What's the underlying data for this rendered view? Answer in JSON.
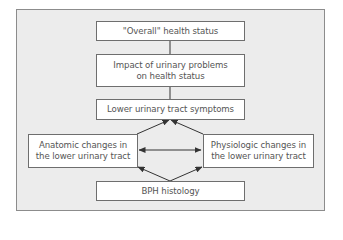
{
  "diagram": {
    "nodes": [
      {
        "id": "overall",
        "label": "\"Overall\" health status"
      },
      {
        "id": "impact",
        "label": "Impact of urinary problems\non health status"
      },
      {
        "id": "luts",
        "label": "Lower urinary tract symptoms"
      },
      {
        "id": "anatomic",
        "label": "Anatomic changes in\nthe lower urinary tract"
      },
      {
        "id": "physiologic",
        "label": "Physiologic changes in\nthe lower urinary tract"
      },
      {
        "id": "bph",
        "label": "BPH histology"
      }
    ],
    "edges": [
      {
        "from": "overall",
        "to": "impact",
        "type": "line"
      },
      {
        "from": "impact",
        "to": "luts",
        "type": "line"
      },
      {
        "from": "anatomic",
        "to": "luts",
        "type": "arrow"
      },
      {
        "from": "physiologic",
        "to": "luts",
        "type": "arrow"
      },
      {
        "from": "anatomic",
        "to": "physiologic",
        "type": "double-arrow"
      },
      {
        "from": "bph",
        "to": "anatomic",
        "type": "arrow"
      },
      {
        "from": "bph",
        "to": "physiologic",
        "type": "arrow"
      }
    ]
  },
  "colors": {
    "panel_background": "#ececec",
    "panel_border": "#8c8c8c",
    "box_background": "#ffffff",
    "box_border": "#6e6e6e",
    "text": "#555555",
    "line": "#333333"
  }
}
